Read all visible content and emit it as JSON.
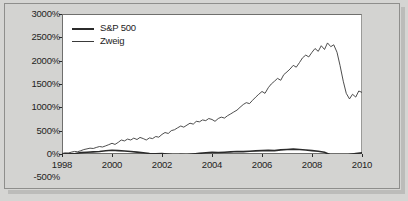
{
  "chart_data": {
    "type": "line",
    "title": "",
    "xlabel": "",
    "ylabel": "",
    "xlim": [
      1998,
      2010
    ],
    "ylim": [
      -500,
      3000
    ],
    "plot_ylim": [
      0,
      3000
    ],
    "grid": false,
    "legend_position": "top-left",
    "ytick_labels": [
      "3000%",
      "2500%",
      "2000%",
      "1500%",
      "1000%",
      "500%",
      "0%",
      "-500%"
    ],
    "ytick_values": [
      3000,
      2500,
      2000,
      1500,
      1000,
      500,
      0,
      -500
    ],
    "xtick_labels": [
      "1998",
      "2000",
      "2002",
      "2004",
      "2006",
      "2008",
      "2010"
    ],
    "xtick_values": [
      1998,
      2000,
      2002,
      2004,
      2006,
      2008,
      2010
    ],
    "series": [
      {
        "name": "S&P 500",
        "color": "#2b2b2b",
        "line_width": 1.6,
        "x": [
          1998.0,
          1998.25,
          1998.5,
          1998.75,
          1999.0,
          1999.25,
          1999.5,
          1999.75,
          2000.0,
          2000.25,
          2000.5,
          2000.75,
          2001.0,
          2001.25,
          2001.5,
          2001.75,
          2002.0,
          2002.25,
          2002.5,
          2002.75,
          2003.0,
          2003.25,
          2003.5,
          2003.75,
          2004.0,
          2004.25,
          2004.5,
          2004.75,
          2005.0,
          2005.25,
          2005.5,
          2005.75,
          2006.0,
          2006.25,
          2006.5,
          2006.75,
          2007.0,
          2007.25,
          2007.5,
          2007.75,
          2008.0,
          2008.25,
          2008.5,
          2008.75,
          2009.0,
          2009.25,
          2009.5,
          2009.75,
          2010.0
        ],
        "values": [
          0,
          12,
          6,
          30,
          38,
          46,
          52,
          70,
          80,
          72,
          64,
          52,
          40,
          28,
          12,
          6,
          10,
          -4,
          -22,
          -14,
          -18,
          -2,
          14,
          26,
          34,
          32,
          38,
          46,
          52,
          50,
          58,
          66,
          72,
          78,
          72,
          88,
          96,
          104,
          96,
          86,
          72,
          58,
          36,
          -22,
          -52,
          -44,
          -10,
          12,
          24
        ]
      },
      {
        "name": "Zweig",
        "color": "#3a3a3a",
        "line_width": 0.9,
        "x": [
          1998.0,
          1998.12,
          1998.25,
          1998.37,
          1998.5,
          1998.62,
          1998.75,
          1998.87,
          1999.0,
          1999.12,
          1999.25,
          1999.37,
          1999.5,
          1999.62,
          1999.75,
          1999.87,
          2000.0,
          2000.12,
          2000.25,
          2000.37,
          2000.5,
          2000.62,
          2000.75,
          2000.87,
          2001.0,
          2001.12,
          2001.25,
          2001.37,
          2001.5,
          2001.62,
          2001.75,
          2001.87,
          2002.0,
          2002.12,
          2002.25,
          2002.37,
          2002.5,
          2002.62,
          2002.75,
          2002.87,
          2003.0,
          2003.12,
          2003.25,
          2003.37,
          2003.5,
          2003.62,
          2003.75,
          2003.87,
          2004.0,
          2004.12,
          2004.25,
          2004.37,
          2004.5,
          2004.62,
          2004.75,
          2004.87,
          2005.0,
          2005.12,
          2005.25,
          2005.37,
          2005.5,
          2005.62,
          2005.75,
          2005.87,
          2006.0,
          2006.12,
          2006.25,
          2006.37,
          2006.5,
          2006.62,
          2006.75,
          2006.87,
          2007.0,
          2007.12,
          2007.25,
          2007.37,
          2007.5,
          2007.62,
          2007.75,
          2007.87,
          2008.0,
          2008.12,
          2008.25,
          2008.37,
          2008.5,
          2008.62,
          2008.75,
          2008.87,
          2009.0,
          2009.12,
          2009.25,
          2009.37,
          2009.5,
          2009.62,
          2009.75,
          2009.87,
          2010.0
        ],
        "values": [
          10,
          25,
          18,
          40,
          55,
          48,
          70,
          95,
          110,
          125,
          118,
          140,
          160,
          150,
          175,
          200,
          230,
          205,
          250,
          300,
          280,
          320,
          300,
          340,
          310,
          355,
          330,
          300,
          345,
          330,
          375,
          360,
          420,
          460,
          440,
          500,
          520,
          560,
          600,
          575,
          620,
          660,
          640,
          700,
          690,
          730,
          715,
          760,
          740,
          700,
          760,
          790,
          770,
          820,
          860,
          900,
          940,
          1000,
          1060,
          1100,
          1080,
          1150,
          1220,
          1280,
          1340,
          1300,
          1420,
          1500,
          1560,
          1620,
          1580,
          1700,
          1760,
          1820,
          1900,
          1860,
          1960,
          2060,
          2120,
          2080,
          2180,
          2260,
          2200,
          2320,
          2240,
          2380,
          2300,
          2340,
          2180,
          1900,
          1560,
          1300,
          1180,
          1280,
          1220,
          1350,
          1320
        ]
      }
    ],
    "annotations": []
  },
  "legend": {
    "entries": [
      {
        "label": "S&P 500"
      },
      {
        "label": "Zweig"
      }
    ]
  },
  "axes": {
    "y_labels": [
      "3000%",
      "2500%",
      "2000%",
      "1500%",
      "1000%",
      "500%",
      "0%",
      "-500%"
    ],
    "x_labels": [
      "1998",
      "2000",
      "2002",
      "2004",
      "2006",
      "2008",
      "2010"
    ]
  },
  "colors": {
    "page_background": "#d5d5d3",
    "plot_background": "#ffffff",
    "axis": "#2b2b2b",
    "sp500_line": "#2b2b2b",
    "zweig_line": "#3a3a3a",
    "text": "#232323"
  }
}
